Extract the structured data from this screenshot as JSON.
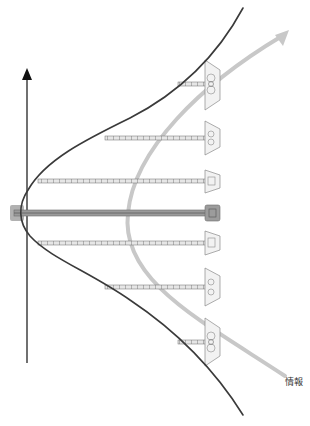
{
  "diagram": {
    "type": "distribution-with-antennas",
    "labels": {
      "info_arrow": "情報"
    },
    "colors": {
      "axis": "#111111",
      "curve": "#3a3a3a",
      "info_arrow": "#c8c8c8",
      "rod": "#6b6b6b",
      "center_rod": "#8a8a8a",
      "receiver": "#9a9a9a",
      "center_block": "#9c9c9c"
    },
    "axis": {
      "x": 27,
      "y_top": 68,
      "y_bottom": 363,
      "direction": "up"
    },
    "rods": [
      {
        "y": 84,
        "x_start": 178,
        "x_end": 212,
        "receiver_size": "large"
      },
      {
        "y": 138,
        "x_start": 105,
        "x_end": 212,
        "receiver_size": "medium"
      },
      {
        "y": 181,
        "x_start": 38,
        "x_end": 212,
        "receiver_size": "small"
      },
      {
        "y": 213,
        "x_start": 12,
        "x_end": 212,
        "receiver_size": "center"
      },
      {
        "y": 243,
        "x_start": 38,
        "x_end": 212,
        "receiver_size": "small"
      },
      {
        "y": 287,
        "x_start": 105,
        "x_end": 212,
        "receiver_size": "medium"
      },
      {
        "y": 342,
        "x_start": 178,
        "x_end": 212,
        "receiver_size": "large"
      }
    ]
  }
}
